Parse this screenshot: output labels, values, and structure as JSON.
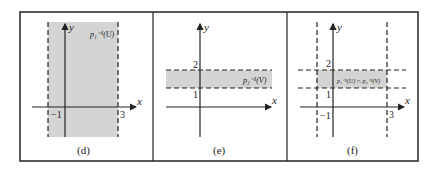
{
  "figure": {
    "panels": [
      {
        "id": "d",
        "caption": "(d)",
        "region_label": "p₁⁻¹(U)",
        "axis_x": "x",
        "axis_y": "y",
        "ticks_x": [
          "−1",
          "3"
        ],
        "ticks_y": []
      },
      {
        "id": "e",
        "caption": "(e)",
        "region_label": "p₂⁻¹(V)",
        "axis_x": "x",
        "axis_y": "y",
        "ticks_x": [],
        "ticks_y": [
          "1",
          "2"
        ]
      },
      {
        "id": "f",
        "caption": "(f)",
        "region_label": "p₁⁻¹(U) ∩ p₂⁻¹(V)",
        "axis_x": "x",
        "axis_y": "y",
        "ticks_x": [
          "−1",
          "3"
        ],
        "ticks_y": [
          "1",
          "2"
        ]
      }
    ],
    "colors": {
      "shade": "#d4d4d4",
      "line": "#222222",
      "border": "#222222"
    }
  }
}
